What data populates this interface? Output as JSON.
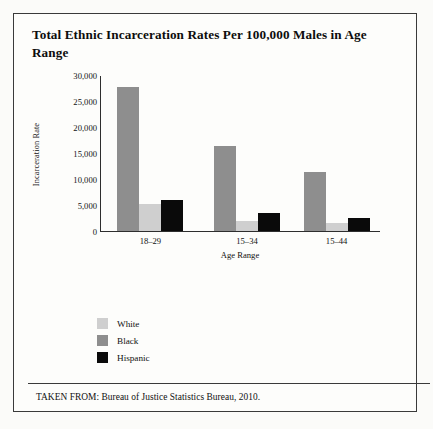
{
  "title": "Total Ethnic Incarceration Rates Per 100,000 Males in Age Range",
  "footer": "TAKEN FROM: Bureau of Justice Statistics Bureau, 2010.",
  "colors": {
    "white_series": "#cfcfcf",
    "black_series": "#8e8e8e",
    "hispanic_series": "#0a0a0a",
    "axis": "#2e2e2e",
    "frame": "#3a3a3a",
    "background": "#fdfdfb",
    "text": "#111111"
  },
  "legend": {
    "position": "below-axis-left",
    "items": [
      {
        "label": "White",
        "color": "#cfcfcf"
      },
      {
        "label": "Black",
        "color": "#8e8e8e"
      },
      {
        "label": "Hispanic",
        "color": "#0a0a0a"
      }
    ]
  },
  "chart_data": {
    "type": "bar",
    "title": "Total Ethnic Incarceration Rates Per 100,000 Males in Age Range",
    "xlabel": "Age Range",
    "ylabel": "Incarceration Rate",
    "categories": [
      "18–29",
      "15–34",
      "15–44"
    ],
    "series": [
      {
        "name": "Black",
        "color": "#8e8e8e",
        "values": [
          28000,
          16500,
          11500
        ]
      },
      {
        "name": "White",
        "color": "#cfcfcf",
        "values": [
          5200,
          1800,
          1500
        ]
      },
      {
        "name": "Hispanic",
        "color": "#0a0a0a",
        "values": [
          6000,
          3500,
          2500
        ]
      }
    ],
    "bar_order": [
      "Black",
      "White",
      "Hispanic"
    ],
    "ylim": [
      0,
      30000
    ],
    "ytick_values": [
      0,
      5000,
      10000,
      15000,
      20000,
      25000,
      30000
    ],
    "ytick_labels": [
      "0",
      "5,000",
      "10,000",
      "15,000",
      "20,000",
      "25,000",
      "30,000"
    ],
    "grid": false,
    "legend_position": "below"
  }
}
